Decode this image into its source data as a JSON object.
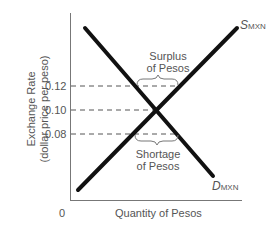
{
  "diagram": {
    "title": "",
    "y_axis_label_line1": "Exchange Rate",
    "y_axis_label_line2": "(dollar price per peso)",
    "x_axis_label": "Quantity of Pesos",
    "origin_label": "0",
    "y_ticks": [
      "0.12",
      "0.10",
      "0.08"
    ],
    "supply_curve": {
      "symbol": "S",
      "subscript": "MXN"
    },
    "demand_curve": {
      "symbol": "D",
      "subscript": "MXN"
    },
    "surplus_label_line1": "Surplus",
    "surplus_label_line2": "of Pesos",
    "shortage_label_line1": "Shortage",
    "shortage_label_line2": "of Pesos",
    "colors": {
      "curve": "#111111",
      "axis": "#555555",
      "text": "#555555"
    }
  }
}
